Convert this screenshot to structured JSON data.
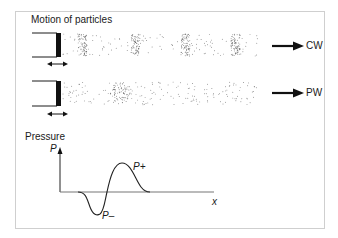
{
  "figure": {
    "title": "Motion of particles",
    "rows": [
      {
        "id": "continuous-wave",
        "label": "CW",
        "pattern": "periodic compression bands",
        "band_x": [
          78,
          131,
          181,
          231
        ]
      },
      {
        "id": "pulse-wave",
        "label": "PW",
        "pattern": "single compression cluster",
        "cluster_x": 120
      }
    ],
    "graph": {
      "title": "Pressure",
      "y_axis_label": "P",
      "x_axis_label": "x",
      "peak_label": "P+",
      "trough_label": "P–"
    },
    "colors": {
      "ink": "#1a1a1a",
      "frame": "#cfcfcf",
      "axis": "#666666",
      "particle": "#555555"
    }
  }
}
